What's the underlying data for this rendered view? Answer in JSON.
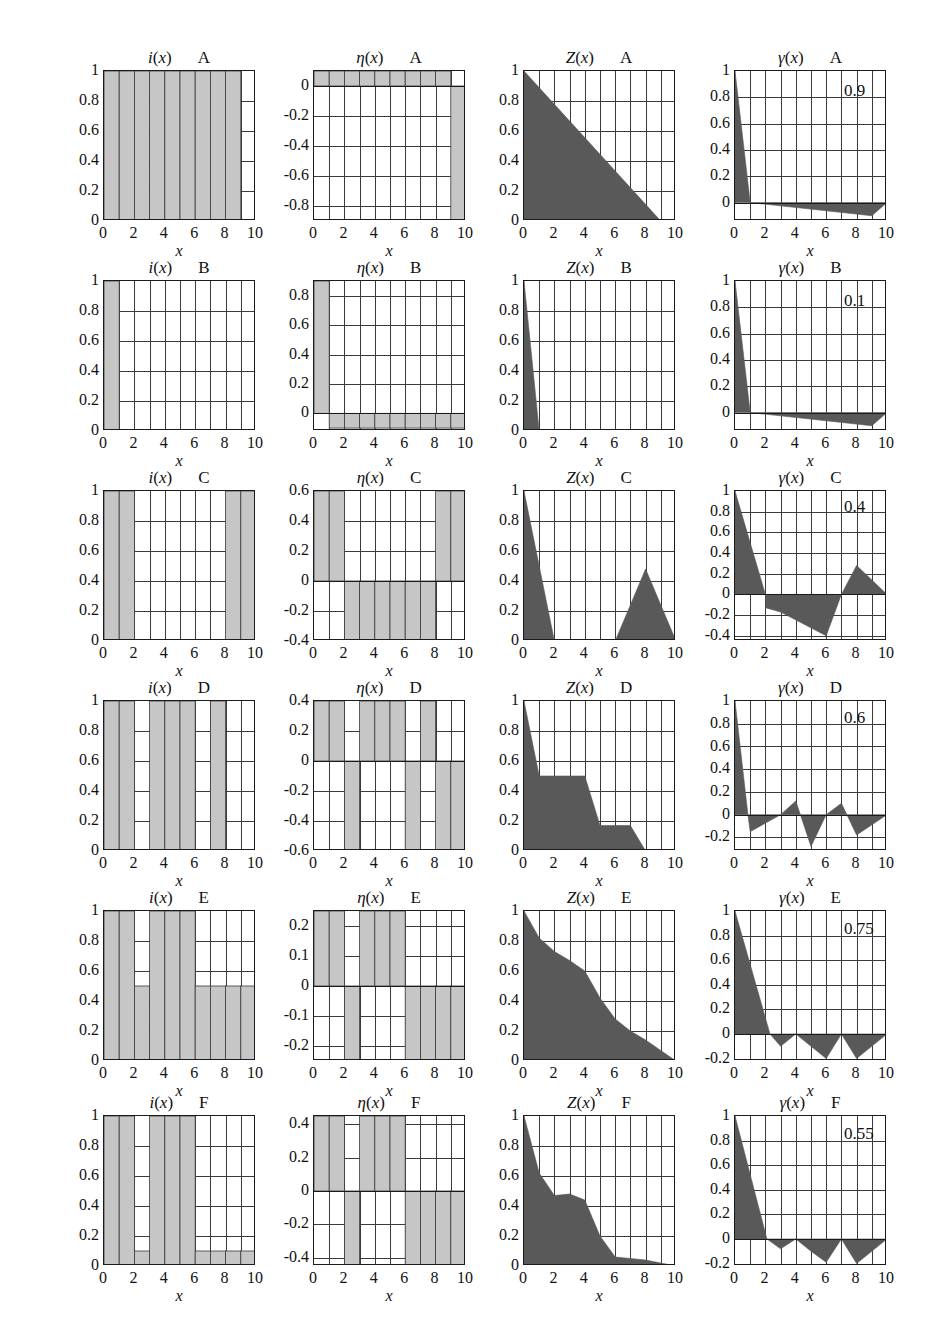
{
  "figure": {
    "rows": [
      "A",
      "B",
      "C",
      "D",
      "E",
      "F"
    ],
    "columns": [
      "i(x)",
      "η(x)",
      "Z(x)",
      "γ(x)"
    ],
    "xlabel": "x",
    "xticks": [
      "0",
      "2",
      "4",
      "6",
      "8",
      "10"
    ],
    "xlim": [
      0,
      10
    ],
    "colors": {
      "light_fill": "#c6c6c6",
      "dark_fill": "#595959",
      "axis": "#1a1a1a",
      "grid": "#3a3a3a"
    }
  },
  "chart_data": [
    {
      "id": "A-i",
      "type": "bar",
      "title": "i(x)",
      "row": "A",
      "xlabel": "x",
      "ylabel": "",
      "xlim": [
        0,
        10
      ],
      "ylim": [
        0,
        1
      ],
      "yticks": [
        "0",
        "0.2",
        "0.4",
        "0.6",
        "0.8",
        "1"
      ],
      "ytickvals": [
        0,
        0.2,
        0.4,
        0.6,
        0.8,
        1
      ],
      "categories": [
        0,
        1,
        2,
        3,
        4,
        5,
        6,
        7,
        8,
        9
      ],
      "values": [
        1,
        1,
        1,
        1,
        1,
        1,
        1,
        1,
        1,
        0
      ],
      "grid": true
    },
    {
      "id": "A-eta",
      "type": "bar",
      "title": "η(x)",
      "row": "A",
      "xlabel": "x",
      "ylabel": "",
      "xlim": [
        0,
        10
      ],
      "ylim": [
        -0.9,
        0.1
      ],
      "yticks": [
        "0",
        "-0.2",
        "-0.4",
        "-0.6",
        "-0.8"
      ],
      "ytickvals": [
        0,
        -0.2,
        -0.4,
        -0.6,
        -0.8
      ],
      "categories": [
        0,
        1,
        2,
        3,
        4,
        5,
        6,
        7,
        8,
        9
      ],
      "values": [
        0.1,
        0.1,
        0.1,
        0.1,
        0.1,
        0.1,
        0.1,
        0.1,
        0.1,
        -0.9
      ],
      "grid": true
    },
    {
      "id": "A-Z",
      "type": "area",
      "title": "Z(x)",
      "row": "A",
      "xlabel": "x",
      "ylabel": "",
      "xlim": [
        0,
        10
      ],
      "ylim": [
        0,
        1
      ],
      "yticks": [
        "0",
        "0.2",
        "0.4",
        "0.6",
        "0.8",
        "1"
      ],
      "ytickvals": [
        0,
        0.2,
        0.4,
        0.6,
        0.8,
        1
      ],
      "x": [
        0,
        9,
        10
      ],
      "y": [
        1,
        0,
        0
      ],
      "grid": true
    },
    {
      "id": "A-gamma",
      "type": "area",
      "title": "γ(x)",
      "row": "A",
      "xlabel": "x",
      "ylabel": "",
      "annotation": "0.9",
      "xlim": [
        0,
        10
      ],
      "ylim": [
        -0.14,
        1
      ],
      "yticks": [
        "0",
        "0.2",
        "0.4",
        "0.6",
        "0.8",
        "1"
      ],
      "ytickvals": [
        0,
        0.2,
        0.4,
        0.6,
        0.8,
        1
      ],
      "x": [
        0,
        1,
        9,
        10
      ],
      "y": [
        1,
        0,
        -0.1,
        0
      ],
      "grid": true
    },
    {
      "id": "B-i",
      "type": "bar",
      "title": "i(x)",
      "row": "B",
      "xlabel": "x",
      "xlim": [
        0,
        10
      ],
      "ylim": [
        0,
        1
      ],
      "yticks": [
        "0",
        "0.2",
        "0.4",
        "0.6",
        "0.8",
        "1"
      ],
      "ytickvals": [
        0,
        0.2,
        0.4,
        0.6,
        0.8,
        1
      ],
      "categories": [
        0,
        1,
        2,
        3,
        4,
        5,
        6,
        7,
        8,
        9
      ],
      "values": [
        1,
        0,
        0,
        0,
        0,
        0,
        0,
        0,
        0,
        0
      ],
      "grid": true
    },
    {
      "id": "B-eta",
      "type": "bar",
      "title": "η(x)",
      "row": "B",
      "xlabel": "x",
      "xlim": [
        0,
        10
      ],
      "ylim": [
        -0.12,
        0.9
      ],
      "yticks": [
        "0",
        "0.2",
        "0.4",
        "0.6",
        "0.8"
      ],
      "ytickvals": [
        0,
        0.2,
        0.4,
        0.6,
        0.8
      ],
      "categories": [
        0,
        1,
        2,
        3,
        4,
        5,
        6,
        7,
        8,
        9
      ],
      "values": [
        0.9,
        -0.1,
        -0.1,
        -0.1,
        -0.1,
        -0.1,
        -0.1,
        -0.1,
        -0.1,
        -0.1
      ],
      "grid": true
    },
    {
      "id": "B-Z",
      "type": "area",
      "title": "Z(x)",
      "row": "B",
      "xlabel": "x",
      "xlim": [
        0,
        10
      ],
      "ylim": [
        0,
        1
      ],
      "yticks": [
        "0",
        "0.2",
        "0.4",
        "0.6",
        "0.8",
        "1"
      ],
      "ytickvals": [
        0,
        0.2,
        0.4,
        0.6,
        0.8,
        1
      ],
      "x": [
        0,
        1,
        10
      ],
      "y": [
        1,
        0,
        0
      ],
      "grid": true
    },
    {
      "id": "B-gamma",
      "type": "area",
      "title": "γ(x)",
      "row": "B",
      "xlabel": "x",
      "annotation": "0.1",
      "xlim": [
        0,
        10
      ],
      "ylim": [
        -0.14,
        1
      ],
      "yticks": [
        "0",
        "0.2",
        "0.4",
        "0.6",
        "0.8",
        "1"
      ],
      "ytickvals": [
        0,
        0.2,
        0.4,
        0.6,
        0.8,
        1
      ],
      "x": [
        0,
        1,
        9,
        10
      ],
      "y": [
        1,
        0,
        -0.1,
        0
      ],
      "grid": true
    },
    {
      "id": "C-i",
      "type": "bar",
      "title": "i(x)",
      "row": "C",
      "xlabel": "x",
      "xlim": [
        0,
        10
      ],
      "ylim": [
        0,
        1
      ],
      "yticks": [
        "0",
        "0.2",
        "0.4",
        "0.6",
        "0.8",
        "1"
      ],
      "ytickvals": [
        0,
        0.2,
        0.4,
        0.6,
        0.8,
        1
      ],
      "categories": [
        0,
        1,
        2,
        3,
        4,
        5,
        6,
        7,
        8,
        9
      ],
      "values": [
        1,
        1,
        0,
        0,
        0,
        0,
        0,
        0,
        1,
        1
      ],
      "grid": true
    },
    {
      "id": "C-eta",
      "type": "bar",
      "title": "η(x)",
      "row": "C",
      "xlabel": "x",
      "xlim": [
        0,
        10
      ],
      "ylim": [
        -0.4,
        0.6
      ],
      "yticks": [
        "0.6",
        "0.4",
        "0.2",
        "0",
        "-0.2",
        "-0.4"
      ],
      "ytickvals": [
        0.6,
        0.4,
        0.2,
        0,
        -0.2,
        -0.4
      ],
      "categories": [
        0,
        1,
        2,
        3,
        4,
        5,
        6,
        7,
        8,
        9
      ],
      "values": [
        0.6,
        0.6,
        -0.4,
        -0.4,
        -0.4,
        -0.4,
        -0.4,
        -0.4,
        0.6,
        0.6
      ],
      "grid": true
    },
    {
      "id": "C-Z",
      "type": "area",
      "title": "Z(x)",
      "row": "C",
      "xlabel": "x",
      "xlim": [
        0,
        10
      ],
      "ylim": [
        0,
        1
      ],
      "yticks": [
        "0",
        "0.2",
        "0.4",
        "0.6",
        "0.8",
        "1"
      ],
      "ytickvals": [
        0,
        0.2,
        0.4,
        0.6,
        0.8,
        1
      ],
      "x": [
        0,
        2,
        6,
        8,
        10
      ],
      "y": [
        1,
        0,
        0,
        0.48,
        0
      ],
      "grid": true
    },
    {
      "id": "C-gamma",
      "type": "area",
      "title": "γ(x)",
      "row": "C",
      "xlabel": "x",
      "annotation": "0.4",
      "xlim": [
        0,
        10
      ],
      "ylim": [
        -0.45,
        1
      ],
      "yticks": [
        "1",
        "0.8",
        "0.6",
        "0.4",
        "0.2",
        "0",
        "-0.2",
        "-0.4"
      ],
      "ytickvals": [
        1,
        0.8,
        0.6,
        0.4,
        0.2,
        0,
        -0.2,
        -0.4
      ],
      "x": [
        0,
        2,
        2.05,
        3,
        6,
        7,
        8,
        10
      ],
      "y": [
        1,
        0,
        -0.13,
        -0.17,
        -0.4,
        0,
        0.28,
        0
      ],
      "grid": true
    },
    {
      "id": "D-i",
      "type": "bar",
      "title": "i(x)",
      "row": "D",
      "xlabel": "x",
      "xlim": [
        0,
        10
      ],
      "ylim": [
        0,
        1
      ],
      "yticks": [
        "0",
        "0.2",
        "0.4",
        "0.6",
        "0.8",
        "1"
      ],
      "ytickvals": [
        0,
        0.2,
        0.4,
        0.6,
        0.8,
        1
      ],
      "categories": [
        0,
        1,
        2,
        3,
        4,
        5,
        6,
        7,
        8,
        9
      ],
      "values": [
        1,
        1,
        0,
        1,
        1,
        1,
        0,
        1,
        0,
        0
      ],
      "grid": true
    },
    {
      "id": "D-eta",
      "type": "bar",
      "title": "η(x)",
      "row": "D",
      "xlabel": "x",
      "xlim": [
        0,
        10
      ],
      "ylim": [
        -0.6,
        0.4
      ],
      "yticks": [
        "0.4",
        "0.2",
        "0",
        "-0.2",
        "-0.4",
        "-0.6"
      ],
      "ytickvals": [
        0.4,
        0.2,
        0,
        -0.2,
        -0.4,
        -0.6
      ],
      "categories": [
        0,
        1,
        2,
        3,
        4,
        5,
        6,
        7,
        8,
        9
      ],
      "values": [
        0.4,
        0.4,
        -0.6,
        0.4,
        0.4,
        0.4,
        -0.6,
        0.4,
        -0.6,
        -0.6
      ],
      "grid": true
    },
    {
      "id": "D-Z",
      "type": "area",
      "title": "Z(x)",
      "row": "D",
      "xlabel": "x",
      "xlim": [
        0,
        10
      ],
      "ylim": [
        0,
        1
      ],
      "yticks": [
        "0",
        "0.2",
        "0.4",
        "0.6",
        "0.8",
        "1"
      ],
      "ytickvals": [
        0,
        0.2,
        0.4,
        0.6,
        0.8,
        1
      ],
      "x": [
        0,
        1,
        4,
        5,
        7,
        8,
        10
      ],
      "y": [
        1,
        0.5,
        0.5,
        0.17,
        0.17,
        0,
        0
      ],
      "grid": true
    },
    {
      "id": "D-gamma",
      "type": "area",
      "title": "γ(x)",
      "row": "D",
      "xlabel": "x",
      "annotation": "0.6",
      "xlim": [
        0,
        10
      ],
      "ylim": [
        -0.32,
        1
      ],
      "yticks": [
        "1",
        "0.8",
        "0.6",
        "0.4",
        "0.2",
        "0",
        "-0.2"
      ],
      "ytickvals": [
        1,
        0.8,
        0.6,
        0.4,
        0.2,
        0,
        -0.2
      ],
      "x": [
        0,
        0.85,
        1,
        3,
        4,
        5,
        6,
        7,
        8,
        10
      ],
      "y": [
        1,
        0,
        -0.15,
        0,
        0.12,
        -0.28,
        0,
        0.1,
        -0.18,
        0
      ],
      "grid": true
    },
    {
      "id": "E-i",
      "type": "bar",
      "title": "i(x)",
      "row": "E",
      "xlabel": "x",
      "xlim": [
        0,
        10
      ],
      "ylim": [
        0,
        1
      ],
      "yticks": [
        "0",
        "0.2",
        "0.4",
        "0.6",
        "0.8",
        "1"
      ],
      "ytickvals": [
        0,
        0.2,
        0.4,
        0.6,
        0.8,
        1
      ],
      "categories": [
        0,
        1,
        2,
        3,
        4,
        5,
        6,
        7,
        8,
        9
      ],
      "values": [
        1,
        1,
        0.5,
        1,
        1,
        1,
        0.5,
        0.5,
        0.5,
        0.5
      ],
      "grid": true
    },
    {
      "id": "E-eta",
      "type": "bar",
      "title": "η(x)",
      "row": "E",
      "xlabel": "x",
      "xlim": [
        0,
        10
      ],
      "ylim": [
        -0.25,
        0.25
      ],
      "yticks": [
        "0.2",
        "0.1",
        "0",
        "-0.1",
        "-0.2"
      ],
      "ytickvals": [
        0.2,
        0.1,
        0,
        -0.1,
        -0.2
      ],
      "categories": [
        0,
        1,
        2,
        3,
        4,
        5,
        6,
        7,
        8,
        9
      ],
      "values": [
        0.25,
        0.25,
        -0.25,
        0.25,
        0.25,
        0.25,
        -0.25,
        -0.25,
        -0.25,
        -0.25
      ],
      "grid": true
    },
    {
      "id": "E-Z",
      "type": "area",
      "title": "Z(x)",
      "row": "E",
      "xlabel": "x",
      "xlim": [
        0,
        10
      ],
      "ylim": [
        0,
        1
      ],
      "yticks": [
        "0",
        "0.2",
        "0.4",
        "0.6",
        "0.8",
        "1"
      ],
      "ytickvals": [
        0,
        0.2,
        0.4,
        0.6,
        0.8,
        1
      ],
      "x": [
        0,
        1,
        2,
        3,
        4,
        5,
        6,
        7,
        8,
        9,
        10
      ],
      "y": [
        1,
        0.82,
        0.73,
        0.67,
        0.6,
        0.42,
        0.28,
        0.2,
        0.14,
        0.07,
        0
      ],
      "grid": true
    },
    {
      "id": "E-gamma",
      "type": "area",
      "title": "γ(x)",
      "row": "E",
      "xlabel": "x",
      "annotation": "0.75",
      "xlim": [
        0,
        10
      ],
      "ylim": [
        -0.22,
        1
      ],
      "yticks": [
        "1",
        "0.8",
        "0.6",
        "0.4",
        "0.2",
        "0",
        "-0.2"
      ],
      "ytickvals": [
        1,
        0.8,
        0.6,
        0.4,
        0.2,
        0,
        -0.2
      ],
      "x": [
        0,
        2.3,
        3,
        4,
        5,
        6,
        7,
        8,
        10
      ],
      "y": [
        1,
        0,
        -0.1,
        0,
        -0.1,
        -0.2,
        0,
        -0.2,
        0
      ],
      "grid": true
    },
    {
      "id": "F-i",
      "type": "bar",
      "title": "i(x)",
      "row": "F",
      "xlabel": "x",
      "xlim": [
        0,
        10
      ],
      "ylim": [
        0,
        1
      ],
      "yticks": [
        "0",
        "0.2",
        "0.4",
        "0.6",
        "0.8",
        "1"
      ],
      "ytickvals": [
        0,
        0.2,
        0.4,
        0.6,
        0.8,
        1
      ],
      "categories": [
        0,
        1,
        2,
        3,
        4,
        5,
        6,
        7,
        8,
        9
      ],
      "values": [
        1,
        1,
        0.1,
        1,
        1,
        1,
        0.1,
        0.1,
        0.1,
        0.1
      ],
      "grid": true
    },
    {
      "id": "F-eta",
      "type": "bar",
      "title": "η(x)",
      "row": "F",
      "xlabel": "x",
      "xlim": [
        0,
        10
      ],
      "ylim": [
        -0.45,
        0.45
      ],
      "yticks": [
        "0.4",
        "0.2",
        "0",
        "-0.2",
        "-0.4"
      ],
      "ytickvals": [
        0.4,
        0.2,
        0,
        -0.2,
        -0.4
      ],
      "categories": [
        0,
        1,
        2,
        3,
        4,
        5,
        6,
        7,
        8,
        9
      ],
      "values": [
        0.45,
        0.45,
        -0.45,
        0.45,
        0.45,
        0.45,
        -0.45,
        -0.45,
        -0.45,
        -0.45
      ],
      "grid": true
    },
    {
      "id": "F-Z",
      "type": "area",
      "title": "Z(x)",
      "row": "F",
      "xlabel": "x",
      "xlim": [
        0,
        10
      ],
      "ylim": [
        0,
        1
      ],
      "yticks": [
        "0",
        "0.2",
        "0.4",
        "0.6",
        "0.8",
        "1"
      ],
      "ytickvals": [
        0,
        0.2,
        0.4,
        0.6,
        0.8,
        1
      ],
      "x": [
        0,
        1,
        2,
        3,
        4,
        5,
        6,
        7,
        8,
        9,
        10
      ],
      "y": [
        1,
        0.62,
        0.47,
        0.48,
        0.44,
        0.2,
        0.06,
        0.05,
        0.04,
        0.02,
        0
      ],
      "grid": true
    },
    {
      "id": "F-gamma",
      "type": "area",
      "title": "γ(x)",
      "row": "F",
      "xlabel": "x",
      "annotation": "0.55",
      "xlim": [
        0,
        10
      ],
      "ylim": [
        -0.22,
        1
      ],
      "yticks": [
        "1",
        "0.8",
        "0.6",
        "0.4",
        "0.2",
        "0",
        "-0.2"
      ],
      "ytickvals": [
        1,
        0.8,
        0.6,
        0.4,
        0.2,
        0,
        -0.2
      ],
      "x": [
        0,
        2.1,
        3,
        4,
        5,
        6,
        7,
        8,
        10
      ],
      "y": [
        1,
        0,
        -0.08,
        0,
        -0.1,
        -0.19,
        0,
        -0.2,
        0
      ],
      "grid": true
    }
  ]
}
